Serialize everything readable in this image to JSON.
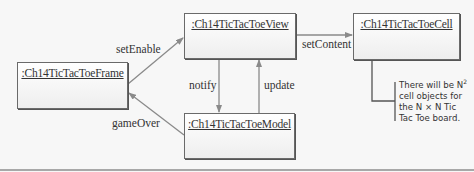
{
  "diagram": {
    "type": "uml-communication-diagram",
    "objects": {
      "frame": ":Ch14TicTacToeFrame",
      "view": ":Ch14TicTacToeView",
      "cell": ":Ch14TicTacToeCell",
      "model": ":Ch14TicTacToeModel"
    },
    "messages": {
      "setEnable": "setEnable",
      "setContent": "setContent",
      "notify": "notify",
      "update": "update",
      "gameOver": "gameOver"
    },
    "note": {
      "line1": "There will be N",
      "line1_sup": "2",
      "line2": "cell objects for",
      "line3": "the N × N Tic",
      "line4": "Tac Toe board."
    },
    "colors": {
      "arrow": "#8a8a8a",
      "box_border": "#6a6a6a",
      "background": "#f7f7f7"
    }
  }
}
